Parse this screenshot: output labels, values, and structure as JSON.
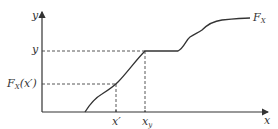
{
  "diagram": {
    "type": "cumulative-distribution-function",
    "labels": {
      "y_axis": "y",
      "x_axis": "x",
      "y_level": "y",
      "fx_prefix": "F",
      "fx_sub": "X",
      "fx_arg": "(x′)",
      "curve_label_main": "F",
      "curve_label_sub": "X",
      "x_prime": "x′",
      "x_y_main": "x",
      "x_y_sub": "y"
    },
    "colors": {
      "axis": "#333333",
      "curve": "#333333",
      "dashed": "#444444"
    }
  }
}
